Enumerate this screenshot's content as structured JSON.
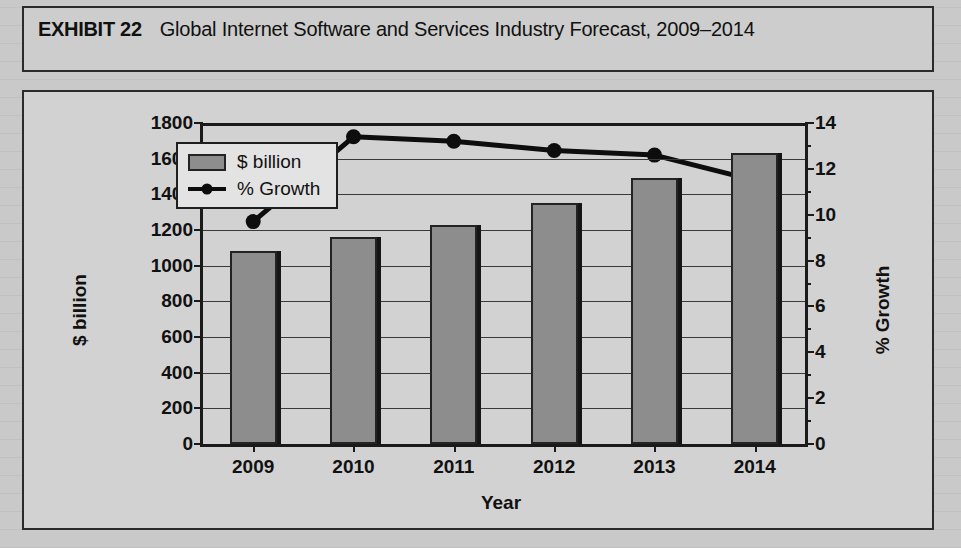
{
  "exhibit": {
    "label": "EXHIBIT 22",
    "title": "Global Internet Software and Services Industry Forecast, 2009–2014"
  },
  "legend": {
    "bar_label": "$ billion",
    "line_label": "% Growth"
  },
  "colors": {
    "bar_fill": "#8d8d8d",
    "bar_outline": "#232323",
    "line": "#0d0d0d",
    "plot_background": "#d2d2d2",
    "frame": "#2b2b2b"
  },
  "chart_data": {
    "type": "bar",
    "title": "Global Internet Software and Services Industry Forecast, 2009–2014",
    "xlabel": "Year",
    "ylabel": "$ billion",
    "y2label": "% Growth",
    "categories": [
      "2009",
      "2010",
      "2011",
      "2012",
      "2013",
      "2014"
    ],
    "ylim": [
      0,
      1800
    ],
    "y2lim": [
      0,
      14
    ],
    "yticks": [
      0,
      200,
      400,
      600,
      800,
      1000,
      1200,
      1400,
      1600,
      1800
    ],
    "y2ticks": [
      0,
      2,
      4,
      6,
      8,
      10,
      12,
      14
    ],
    "grid": true,
    "legend_position": "upper-center-left",
    "series": [
      {
        "name": "$ billion",
        "type": "bar",
        "axis": "left",
        "values": [
          1080,
          1160,
          1230,
          1350,
          1490,
          1630
        ]
      },
      {
        "name": "% Growth",
        "type": "line",
        "axis": "right",
        "values": [
          9.7,
          13.4,
          13.2,
          12.8,
          12.6,
          11.5
        ]
      }
    ]
  }
}
